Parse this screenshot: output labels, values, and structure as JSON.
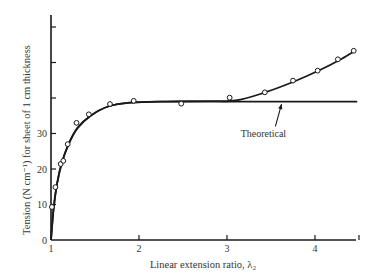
{
  "chart_data": {
    "type": "line",
    "title": "",
    "xlabel": "Linear extension ratio, λ₂",
    "ylabel": "Tension (N cm⁻¹) for sheet of 1 cm thickness",
    "xlim": [
      1,
      4.5
    ],
    "ylim": [
      0,
      63
    ],
    "x_ticks": [
      1,
      2,
      3,
      4,
      4.5
    ],
    "x_tick_labels": [
      "1",
      "2",
      "3",
      "4",
      ""
    ],
    "y_ticks": [
      0,
      10,
      20,
      30,
      40,
      50,
      60
    ],
    "y_tick_labels": [
      "0",
      "10",
      "20",
      "30",
      "",
      "",
      ""
    ],
    "grid": false,
    "legend": null,
    "series": [
      {
        "name": "Experimental",
        "style": "line+open-circle-markers",
        "points": [
          {
            "x": 1.01,
            "y": 9.3
          },
          {
            "x": 1.05,
            "y": 14.9
          },
          {
            "x": 1.11,
            "y": 21.4
          },
          {
            "x": 1.14,
            "y": 22.3
          },
          {
            "x": 1.19,
            "y": 27.0
          },
          {
            "x": 1.29,
            "y": 33.0
          },
          {
            "x": 1.43,
            "y": 35.4
          },
          {
            "x": 1.67,
            "y": 38.3
          },
          {
            "x": 1.94,
            "y": 39.2
          },
          {
            "x": 2.48,
            "y": 38.4
          },
          {
            "x": 3.03,
            "y": 40.1
          },
          {
            "x": 3.43,
            "y": 41.6
          },
          {
            "x": 3.75,
            "y": 44.9
          },
          {
            "x": 4.03,
            "y": 47.7
          },
          {
            "x": 4.26,
            "y": 50.9
          },
          {
            "x": 4.44,
            "y": 53.3
          }
        ],
        "curve": [
          {
            "x": 1.0,
            "y": 0
          },
          {
            "x": 1.03,
            "y": 9
          },
          {
            "x": 1.07,
            "y": 16
          },
          {
            "x": 1.12,
            "y": 21.5
          },
          {
            "x": 1.2,
            "y": 27
          },
          {
            "x": 1.3,
            "y": 31.5
          },
          {
            "x": 1.45,
            "y": 35
          },
          {
            "x": 1.65,
            "y": 37.6
          },
          {
            "x": 1.9,
            "y": 38.7
          },
          {
            "x": 2.3,
            "y": 39.0
          },
          {
            "x": 2.8,
            "y": 39.1
          },
          {
            "x": 3.1,
            "y": 39.3
          },
          {
            "x": 3.4,
            "y": 41.3
          },
          {
            "x": 3.75,
            "y": 44.5
          },
          {
            "x": 4.05,
            "y": 47.8
          },
          {
            "x": 4.3,
            "y": 51
          },
          {
            "x": 4.46,
            "y": 53.4
          }
        ]
      },
      {
        "name": "Theoretical",
        "style": "line",
        "curve": [
          {
            "x": 1.0,
            "y": 0
          },
          {
            "x": 1.03,
            "y": 9
          },
          {
            "x": 1.07,
            "y": 16
          },
          {
            "x": 1.12,
            "y": 21.5
          },
          {
            "x": 1.2,
            "y": 27
          },
          {
            "x": 1.3,
            "y": 31.5
          },
          {
            "x": 1.45,
            "y": 35
          },
          {
            "x": 1.65,
            "y": 37.6
          },
          {
            "x": 1.9,
            "y": 38.7
          },
          {
            "x": 2.3,
            "y": 39.0
          },
          {
            "x": 2.8,
            "y": 39.0
          },
          {
            "x": 3.5,
            "y": 39.0
          },
          {
            "x": 4.48,
            "y": 39.0
          }
        ]
      }
    ],
    "annotations": [
      {
        "text": "Theoretical",
        "arrow_from": {
          "x": 3.55,
          "y": 32
        },
        "arrow_to": {
          "x": 3.62,
          "y": 38.3
        }
      }
    ]
  },
  "colors": {
    "line": "#1a1a1a",
    "marker_fill": "#ffffff",
    "text": "#333333",
    "background": "#ffffff"
  }
}
